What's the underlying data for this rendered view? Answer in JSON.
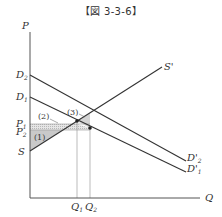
{
  "title": "【図 3-3-6】",
  "diagram": {
    "axes": {
      "y_label": "P",
      "x_label": "Q"
    },
    "curves": [
      {
        "name": "S",
        "label": "S",
        "type": "supply"
      },
      {
        "name": "S'",
        "label": "S'",
        "type": "supply-end-label"
      },
      {
        "name": "D2",
        "start_label": "D",
        "start_sub": "2",
        "end_label": "D'",
        "end_sub": "2"
      },
      {
        "name": "D1",
        "start_label": "D",
        "start_sub": "1",
        "end_label": "D'",
        "end_sub": "1"
      }
    ],
    "price_levels": [
      {
        "label": "P",
        "sub": "1"
      },
      {
        "label": "P",
        "sub": "2"
      }
    ],
    "quantities": [
      {
        "label": "Q",
        "sub": "1"
      },
      {
        "label": "Q",
        "sub": "2"
      }
    ],
    "regions": [
      {
        "label": "(1)",
        "fill": "#c8c8c8"
      },
      {
        "label": "(2)",
        "fill": "#e2e2e2"
      },
      {
        "label": "(3)",
        "fill": "#d6d6d6"
      }
    ],
    "colors": {
      "line": "#333333",
      "guide": "#aaaaaa"
    }
  }
}
